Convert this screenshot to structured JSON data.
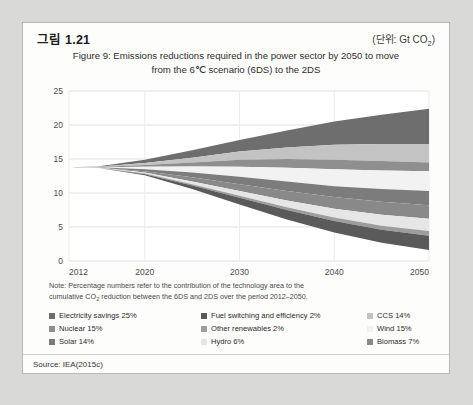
{
  "header": {
    "figure_number": "그림 1.21",
    "unit_prefix": "(단위: Gt CO",
    "unit_sub": "2",
    "unit_suffix": ")"
  },
  "title": {
    "line1": "Figure 9: Emissions reductions required in the power sector by 2050 to move",
    "line2": "from the 6℃ scenario (6DS) to the 2DS"
  },
  "note": {
    "line1": "Note: Percentage numbers refer to the contribution of the technology area to the",
    "line2_a": "cumulative CO",
    "line2_sub": "2",
    "line2_b": " reduction between the 6DS and 2DS over the period 2012–2050."
  },
  "legend": {
    "items": [
      {
        "label": "Electricity savings 25%",
        "color": "#6e6e6e",
        "name": "electricity-savings"
      },
      {
        "label": "Fuel switching and efficiency 2%",
        "color": "#5a5a5a",
        "name": "fuel-switching-efficiency"
      },
      {
        "label": "CCS 14%",
        "color": "#c3c3c3",
        "name": "ccs"
      },
      {
        "label": "Nuclear 15%",
        "color": "#8f8f8f",
        "name": "nuclear"
      },
      {
        "label": "Other renewables 2%",
        "color": "#9d9d9d",
        "name": "other-renewables"
      },
      {
        "label": "Wind 15%",
        "color": "#f2f2f2",
        "name": "wind"
      },
      {
        "label": "Solar 14%",
        "color": "#7c7c7c",
        "name": "solar"
      },
      {
        "label": "Hydro 6%",
        "color": "#e6e6e6",
        "name": "hydro"
      },
      {
        "label": "Biomass 7%",
        "color": "#898989",
        "name": "biomass"
      }
    ]
  },
  "source": "Source: IEA(2015c)",
  "chart_data": {
    "type": "area",
    "title": "Figure 9: Emissions reductions required in the power sector by 2050 to move from the 6℃ scenario (6DS) to the 2DS",
    "xlabel": "",
    "ylabel": "Gt CO2",
    "xlim": [
      2012,
      2050
    ],
    "ylim": [
      0,
      25
    ],
    "xticks": [
      2012,
      2020,
      2030,
      2040,
      2050
    ],
    "yticks": [
      0,
      5,
      10,
      15,
      20,
      25
    ],
    "grid": true,
    "legend_position": "bottom",
    "x": [
      2012,
      2015,
      2020,
      2025,
      2030,
      2035,
      2040,
      2045,
      2050
    ],
    "baseline_6ds": [
      13.8,
      13.9,
      14.9,
      16.3,
      17.8,
      19.2,
      20.5,
      21.5,
      22.4
    ],
    "target_2ds": [
      13.8,
      13.7,
      12.6,
      10.6,
      8.3,
      6.1,
      4.2,
      2.7,
      1.6
    ],
    "series": [
      {
        "name": "Electricity savings 25%",
        "color": "#6e6e6e",
        "percent": 25,
        "upper": [
          13.8,
          13.9,
          14.9,
          16.3,
          17.8,
          19.2,
          20.5,
          21.5,
          22.4
        ],
        "lower": [
          13.8,
          13.85,
          14.4,
          15.2,
          16.1,
          16.7,
          17.1,
          17.2,
          17.2
        ]
      },
      {
        "name": "CCS 14%",
        "color": "#c3c3c3",
        "percent": 14,
        "upper": [
          13.8,
          13.85,
          14.4,
          15.2,
          16.1,
          16.7,
          17.1,
          17.2,
          17.2
        ],
        "lower": [
          13.8,
          13.82,
          14.1,
          14.5,
          14.9,
          15.0,
          14.9,
          14.7,
          14.5
        ]
      },
      {
        "name": "Nuclear 15%",
        "color": "#8f8f8f",
        "percent": 15,
        "upper": [
          13.8,
          13.82,
          14.1,
          14.5,
          14.9,
          15.0,
          14.9,
          14.7,
          14.5
        ],
        "lower": [
          13.8,
          13.8,
          13.85,
          13.9,
          13.85,
          13.7,
          13.5,
          13.3,
          13.2
        ]
      },
      {
        "name": "Wind 15%",
        "color": "#f2f2f2",
        "percent": 15,
        "upper": [
          13.8,
          13.8,
          13.85,
          13.9,
          13.85,
          13.7,
          13.5,
          13.3,
          13.2
        ],
        "lower": [
          13.8,
          13.78,
          13.5,
          13.0,
          12.4,
          11.7,
          11.0,
          10.6,
          10.3
        ]
      },
      {
        "name": "Solar 14%",
        "color": "#7c7c7c",
        "percent": 14,
        "upper": [
          13.8,
          13.78,
          13.5,
          13.0,
          12.4,
          11.7,
          11.0,
          10.6,
          10.3
        ],
        "lower": [
          13.8,
          13.76,
          13.2,
          12.3,
          11.3,
          10.3,
          9.4,
          8.7,
          8.2
        ]
      },
      {
        "name": "Biomass 7%",
        "color": "#898989",
        "percent": 7,
        "upper": [
          13.8,
          13.76,
          13.2,
          12.3,
          11.3,
          10.3,
          9.4,
          8.7,
          8.2
        ],
        "lower": [
          13.8,
          13.74,
          13.0,
          11.7,
          10.3,
          8.9,
          7.7,
          6.8,
          6.2
        ]
      },
      {
        "name": "Hydro 6%",
        "color": "#e6e6e6",
        "percent": 6,
        "upper": [
          13.8,
          13.74,
          13.0,
          11.7,
          10.3,
          8.9,
          7.7,
          6.8,
          6.2
        ],
        "lower": [
          13.8,
          13.72,
          12.85,
          11.3,
          9.6,
          7.9,
          6.4,
          5.2,
          4.4
        ]
      },
      {
        "name": "Other renewables 2%",
        "color": "#9d9d9d",
        "percent": 2,
        "upper": [
          13.8,
          13.72,
          12.85,
          11.3,
          9.6,
          7.9,
          6.4,
          5.2,
          4.4
        ],
        "lower": [
          13.8,
          13.71,
          12.75,
          11.1,
          9.3,
          7.5,
          5.9,
          4.6,
          3.7
        ]
      },
      {
        "name": "Fuel switching and efficiency 2%",
        "color": "#5a5a5a",
        "percent": 2,
        "upper": [
          13.8,
          13.71,
          12.75,
          11.1,
          9.3,
          7.5,
          5.9,
          4.6,
          3.7
        ],
        "lower": [
          13.8,
          13.7,
          12.6,
          10.6,
          8.3,
          6.1,
          4.2,
          2.7,
          1.6
        ]
      }
    ]
  }
}
